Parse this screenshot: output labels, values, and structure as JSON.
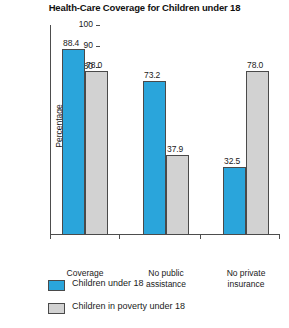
{
  "chart_data": {
    "type": "bar",
    "title": "Health-Care Coverage for Children under 18",
    "xlabel": "",
    "ylabel": "Percentage",
    "ylim": [
      0,
      100
    ],
    "yticks": [
      10,
      20,
      30,
      40,
      50,
      60,
      70,
      80,
      90,
      100
    ],
    "grid": false,
    "legend_position": "bottom-left",
    "categories": [
      "Coverage",
      "No public assistance",
      "No private insurance"
    ],
    "category_lines": [
      [
        "Coverage"
      ],
      [
        "No public",
        "assistance"
      ],
      [
        "No private",
        "insurance"
      ]
    ],
    "series": [
      {
        "name": "Children under 18",
        "color": "#2aa5db",
        "values": [
          88.4,
          73.2,
          32.5
        ],
        "labels": [
          "88.4",
          "73.2",
          "32.5"
        ]
      },
      {
        "name": "Children in poverty under 18",
        "color": "#d2d2d2",
        "values": [
          78.0,
          37.9,
          78.0
        ],
        "labels": [
          "78.0",
          "37.9",
          "78.0"
        ]
      }
    ]
  },
  "axis": {
    "tick_labels": [
      "100",
      "90",
      "80",
      "70",
      "60",
      "50",
      "40",
      "30",
      "20",
      "10"
    ]
  },
  "legend": {
    "items": [
      {
        "label": "Children under 18",
        "color": "#2aa5db"
      },
      {
        "label": "Children in poverty under 18",
        "color": "#d2d2d2"
      }
    ]
  }
}
